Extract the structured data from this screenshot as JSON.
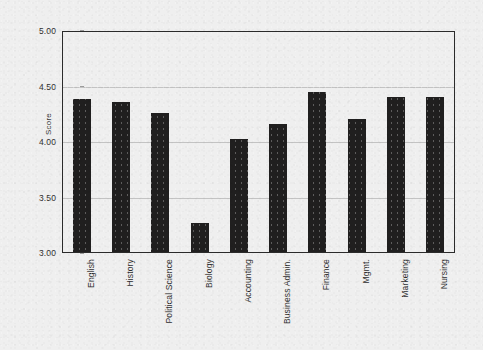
{
  "chart_data": {
    "type": "bar",
    "title": "",
    "xlabel": "",
    "ylabel": "Score",
    "ylim": [
      3.0,
      5.0
    ],
    "ytick_labels": [
      "5.00",
      "4.50",
      "4.00",
      "3.50",
      "3.00"
    ],
    "ytick_values": [
      5.0,
      4.5,
      4.0,
      3.5,
      3.0
    ],
    "grid": true,
    "legend": "none",
    "bar_color": "#201f1f",
    "background_color": "#efefef",
    "categories": [
      "English",
      "History",
      "Political Science",
      "Biology",
      "Accounting",
      "Business Admin.",
      "Finance",
      "Mgmt.",
      "Marketing",
      "Nursing"
    ],
    "values": [
      4.39,
      4.36,
      4.26,
      3.27,
      4.03,
      4.16,
      4.45,
      4.21,
      4.41,
      4.41
    ]
  }
}
